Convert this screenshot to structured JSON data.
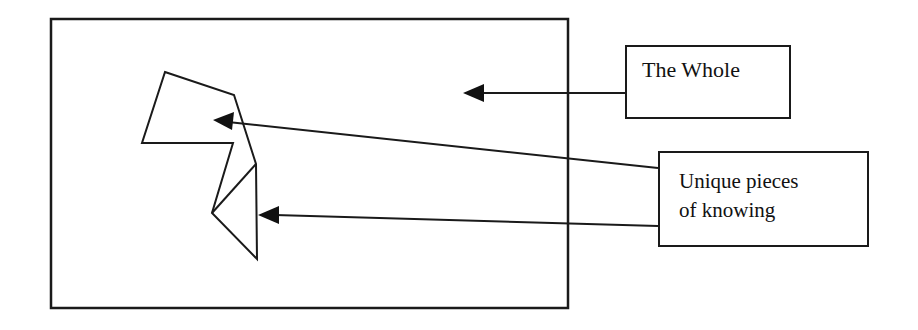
{
  "diagram": {
    "labels": {
      "whole": "The Whole",
      "unique_line1": "Unique pieces",
      "unique_line2": "of knowing"
    },
    "colors": {
      "stroke": "#1a1a1a",
      "background": "#ffffff"
    },
    "shapes": {
      "outer_rectangle": {
        "x": 51,
        "y": 19,
        "width": 517,
        "height": 289
      },
      "polygon_piece": [
        [
          165,
          72
        ],
        [
          234,
          95
        ],
        [
          256,
          164
        ],
        [
          257,
          259
        ],
        [
          212,
          213
        ],
        [
          233,
          143
        ],
        [
          142,
          143
        ]
      ],
      "triangle_piece": [
        [
          256,
          164
        ],
        [
          257,
          259
        ],
        [
          212,
          213
        ]
      ]
    },
    "arrows": [
      {
        "from": "The Whole",
        "to": "outer_rectangle",
        "tip": [
          463,
          93
        ]
      },
      {
        "from": "Unique pieces of knowing",
        "to": "polygon_piece",
        "tip": [
          213,
          120
        ]
      },
      {
        "from": "Unique pieces of knowing",
        "to": "triangle_piece",
        "tip": [
          258,
          215
        ]
      }
    ]
  }
}
